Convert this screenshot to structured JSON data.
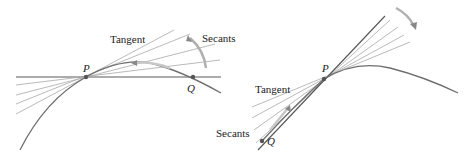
{
  "figure": {
    "left_panel": {
      "labels": {
        "tangent": "Tangent",
        "secants": "Secants",
        "point_p": "P",
        "point_q": "Q"
      }
    },
    "right_panel": {
      "labels": {
        "tangent": "Tangent",
        "secants": "Secants",
        "point_p": "P",
        "point_q": "Q"
      }
    },
    "colors": {
      "curve": "#6e6e6e",
      "lines": "#9a9a9a",
      "tangent": "#555555",
      "arrow": "#a0a0a0",
      "text": "#222222"
    }
  }
}
